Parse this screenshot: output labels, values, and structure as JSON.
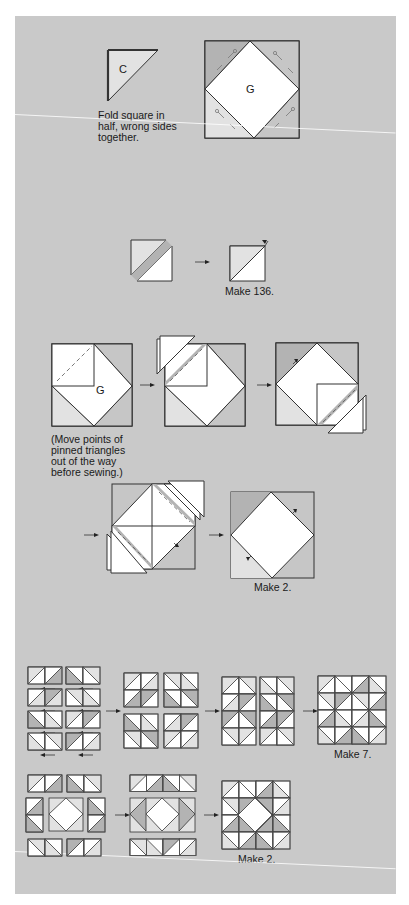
{
  "colors": {
    "background": "#c9c9c9",
    "dark_fabric": "#b3b3b3",
    "light_fabric": "#e2e2e2",
    "white_fabric": "#ffffff",
    "line": "#3a3a3a"
  },
  "step1": {
    "triangle_label": "C",
    "caption": "Fold square in\nhalf, wrong sides\ntogether.",
    "block_label": "G"
  },
  "step2": {
    "caption": "Make 136."
  },
  "step3": {
    "block_label": "G",
    "caption": "(Move points of\npinned triangles\nout of the way\nbefore sewing.)"
  },
  "step4": {
    "caption": "Make 2."
  },
  "step5": {
    "caption": "Make 7."
  },
  "step6": {
    "caption": "Make 2."
  }
}
